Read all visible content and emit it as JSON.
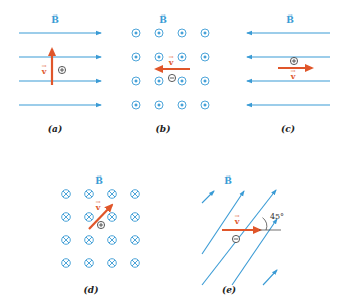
{
  "figure": {
    "colors": {
      "field": "#3a9bd5",
      "velocity": "#e0562a",
      "charge": "#333333",
      "caption": "#222222"
    },
    "field_label": "B",
    "velocity_label": "v",
    "vector_mark": "→",
    "panels": [
      {
        "id": "a",
        "caption": "(a)",
        "field_direction": "right",
        "velocity_direction": "up",
        "charge": "+"
      },
      {
        "id": "b",
        "caption": "(b)",
        "field_direction": "out of page",
        "velocity_direction": "left",
        "charge": "−"
      },
      {
        "id": "c",
        "caption": "(c)",
        "field_direction": "left",
        "velocity_direction": "right",
        "charge": "+"
      },
      {
        "id": "d",
        "caption": "(d)",
        "field_direction": "into page",
        "velocity_direction": "up-right",
        "charge": "+"
      },
      {
        "id": "e",
        "caption": "(e)",
        "field_direction": "up-right at 45°",
        "velocity_direction": "right",
        "charge": "−",
        "angle_label": "45°"
      }
    ]
  }
}
